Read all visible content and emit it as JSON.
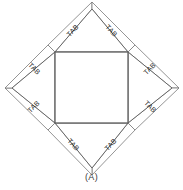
{
  "figure": {
    "caption": "(A)",
    "title_alt": "Net of a square antiprism-like solid with glue tabs",
    "colors": {
      "background": "#ffffff",
      "face_stroke": "#555555",
      "flap_stroke": "#5a5a5a",
      "tab_stroke": "#7a7a7a",
      "fold_stroke": "#6b6b6b",
      "text": "#2b2b2b"
    },
    "geometry": {
      "canvas": {
        "width": 183,
        "height": 190
      },
      "center_square": {
        "top_left": [
          55,
          52
        ],
        "top_right": [
          128,
          52
        ],
        "bottom_right": [
          128,
          123
        ],
        "bottom_left": [
          55,
          123
        ]
      },
      "apexes": {
        "top": [
          92,
          9
        ],
        "right": [
          172,
          88
        ],
        "bottom": [
          92,
          168
        ],
        "left": [
          12,
          88
        ]
      }
    },
    "tabs": [
      {
        "id": "tab-top-left",
        "label": "TAB",
        "x": 73,
        "y": 31,
        "rotation": -47
      },
      {
        "id": "tab-top-right",
        "label": "TAB",
        "x": 111,
        "y": 31,
        "rotation": 47
      },
      {
        "id": "tab-right-top",
        "label": "TAB",
        "x": 150,
        "y": 69,
        "rotation": -45
      },
      {
        "id": "tab-right-bottom",
        "label": "TAB",
        "x": 150,
        "y": 107,
        "rotation": 45
      },
      {
        "id": "tab-bottom-right",
        "label": "TAB",
        "x": 111,
        "y": 145,
        "rotation": -47
      },
      {
        "id": "tab-bottom-left",
        "label": "TAB",
        "x": 73,
        "y": 145,
        "rotation": 47
      },
      {
        "id": "tab-left-bottom",
        "label": "TAB",
        "x": 34,
        "y": 107,
        "rotation": -45
      },
      {
        "id": "tab-left-top",
        "label": "TAB",
        "x": 34,
        "y": 69,
        "rotation": 45
      }
    ],
    "flaps": [
      {
        "id": "flap-top",
        "points": "55,52 128,52 92,9"
      },
      {
        "id": "flap-right",
        "points": "128,52 128,123 172,88"
      },
      {
        "id": "flap-bottom",
        "points": "55,123 128,123 92,168"
      },
      {
        "id": "flap-left",
        "points": "55,52 55,123 12,88"
      }
    ],
    "tab_polygons": [
      {
        "id": "tabpoly-top-left",
        "points": "55,52 92,9 92,2 48,45"
      },
      {
        "id": "tabpoly-top-right",
        "points": "92,9 128,52 135,45 92,2"
      },
      {
        "id": "tabpoly-right-top",
        "points": "128,52 172,88 179,88 135,45"
      },
      {
        "id": "tabpoly-right-bottom",
        "points": "172,88 128,123 135,130 179,88"
      },
      {
        "id": "tabpoly-bottom-right",
        "points": "128,123 92,168 92,175 135,130"
      },
      {
        "id": "tabpoly-bottom-left",
        "points": "92,168 55,123 48,130 92,175"
      },
      {
        "id": "tabpoly-left-bottom",
        "points": "55,123 12,88 5,88 48,130"
      },
      {
        "id": "tabpoly-left-top",
        "points": "12,88 55,52 48,45 5,88"
      }
    ]
  }
}
